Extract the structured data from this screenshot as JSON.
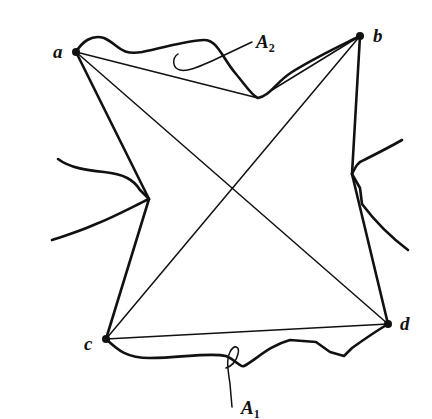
{
  "diagram": {
    "colors": {
      "ink": "#111111",
      "background": "#ffffff"
    },
    "vertices": [
      {
        "id": "a",
        "label": "a",
        "x": 76,
        "y": 52
      },
      {
        "id": "b",
        "label": "b",
        "x": 360,
        "y": 36
      },
      {
        "id": "c",
        "label": "c",
        "x": 106,
        "y": 339
      },
      {
        "id": "d",
        "label": "d",
        "x": 388,
        "y": 324
      }
    ],
    "chords": [
      "a-b",
      "a-c",
      "a-d",
      "b-c",
      "b-d",
      "c-d"
    ],
    "regions": [
      {
        "id": "A1",
        "letter": "A",
        "subscript": "1"
      },
      {
        "id": "A2",
        "letter": "A",
        "subscript": "2"
      }
    ]
  }
}
